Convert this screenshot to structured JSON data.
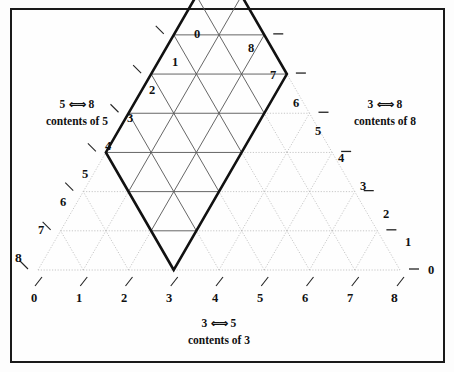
{
  "figure": {
    "type": "triangular-coordinate-diagram",
    "background_color": "#fefefe",
    "frame_color": "#1a1a1a",
    "grid_color_inside": "#555555",
    "grid_color_outside": "#b9b9b9",
    "bold_region_color": "#111111"
  },
  "axes": {
    "bottom": {
      "tick_labels": [
        "0",
        "1",
        "2",
        "3",
        "4",
        "5",
        "6",
        "7",
        "8"
      ],
      "tick_glyph": "/",
      "caption_line1_left": "3",
      "caption_line1_arrows": "⇐⇒",
      "caption_line1_right": "5",
      "caption_line2": "contents of 3"
    },
    "left": {
      "tick_labels": [
        "0",
        "1",
        "2",
        "3",
        "4",
        "5",
        "6",
        "7",
        "8"
      ],
      "tick_glyph": "\\",
      "caption_line1_left": "5",
      "caption_line1_arrows": "⇐⇒",
      "caption_line1_right": "8",
      "caption_line2": "contents of 5"
    },
    "right": {
      "tick_labels": [
        "0",
        "1",
        "2",
        "3",
        "4",
        "5",
        "6",
        "7",
        "8"
      ],
      "tick_glyph": "—",
      "caption_line1_left": "3",
      "caption_line1_arrows": "⇐⇒",
      "caption_line1_right": "8",
      "caption_line2": "contents of 8"
    }
  },
  "chart_data": {
    "type": "diagram",
    "title": "",
    "grid_divisions": 8,
    "bottom_axis_label": "contents of 3",
    "left_axis_label": "contents of 5",
    "right_axis_label": "contents of 8",
    "bottom_axis_ticks": [
      0,
      1,
      2,
      3,
      4,
      5,
      6,
      7,
      8
    ],
    "left_axis_ticks": [
      0,
      1,
      2,
      3,
      4,
      5,
      6,
      7,
      8
    ],
    "right_axis_ticks": [
      0,
      1,
      2,
      3,
      4,
      5,
      6,
      7,
      8
    ],
    "highlighted_region": {
      "shape": "rhombus",
      "vertices_bottom_axis_units": [
        [
          3,
          0
        ],
        [
          5.5,
          0
        ],
        [
          8,
          0
        ],
        [
          5.5,
          0
        ]
      ],
      "description": "bold rhombus covering the reachable states",
      "bottom_vertex": 3,
      "side_a_units": 5,
      "side_b_units": 3
    }
  }
}
